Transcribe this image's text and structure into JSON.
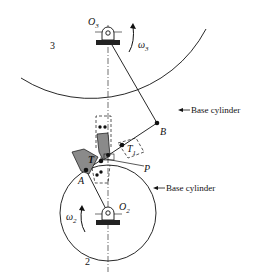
{
  "diagram": {
    "type": "involute gear tooth contact diagram",
    "labels": {
      "gear_top_number": "3",
      "gear_bottom_number": "2",
      "pivot_top": "O",
      "pivot_top_sub": "3",
      "pivot_bottom": "O",
      "pivot_bottom_sub": "2",
      "omega_top": "ω",
      "omega_top_sub": "3",
      "omega_bottom": "ω",
      "omega_bottom_sub": "2",
      "point_B": "B",
      "point_A": "A",
      "point_P": "P",
      "point_T": "T",
      "point_T1": "T",
      "point_T1_sub": "1",
      "base_cylinder_top": "Base cylinder",
      "base_cylinder_bottom": "Base cylinder"
    },
    "colors": {
      "line": "#111111",
      "tooth_fill": "#8a8a8a",
      "background": "#ffffff"
    }
  }
}
